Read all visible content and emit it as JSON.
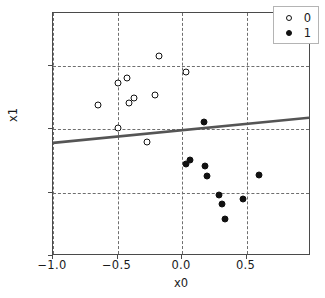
{
  "figure": {
    "background_color": "#ffffff",
    "axes_edge_color": "#4a4a4a",
    "grid_color": "#6e6e6e",
    "marker_color": "#111111",
    "line_color": "#555555"
  },
  "legend": {
    "position": "upper-right",
    "entries": [
      {
        "label": "0",
        "marker": "open-circle",
        "name": "legend-entry-class-0"
      },
      {
        "label": "1",
        "marker": "filled-circle",
        "name": "legend-entry-class-1"
      }
    ]
  },
  "chart_data": {
    "type": "scatter",
    "title": "",
    "xlabel": "x0",
    "ylabel": "x1",
    "xlim": [
      -1.0,
      1.0
    ],
    "ylim": [
      -1.0,
      0.92
    ],
    "grid": true,
    "grid_style": "dashed",
    "xticks": [
      -1.0,
      -0.5,
      0.0,
      0.5
    ],
    "xticklabels": [
      "−1.0",
      "−0.5",
      "0.0",
      "0.5"
    ],
    "yticks": [
      0.5,
      0.0,
      -0.5,
      -1.0
    ],
    "yticklabels": [
      "0.5",
      "0.0",
      "−0.5",
      "−1.0"
    ],
    "series": [
      {
        "name": "0",
        "marker": "open-circle",
        "points": [
          {
            "x": -0.65,
            "y": 0.19
          },
          {
            "x": -0.5,
            "y": 0.37
          },
          {
            "x": -0.5,
            "y": 0.01
          },
          {
            "x": -0.43,
            "y": 0.41
          },
          {
            "x": -0.41,
            "y": 0.21
          },
          {
            "x": -0.37,
            "y": 0.25
          },
          {
            "x": -0.27,
            "y": -0.1
          },
          {
            "x": -0.21,
            "y": 0.27
          },
          {
            "x": -0.18,
            "y": 0.58
          },
          {
            "x": 0.03,
            "y": 0.45
          }
        ]
      },
      {
        "name": "1",
        "marker": "filled-circle",
        "points": [
          {
            "x": 0.03,
            "y": -0.27
          },
          {
            "x": 0.06,
            "y": -0.24
          },
          {
            "x": 0.17,
            "y": 0.06
          },
          {
            "x": 0.18,
            "y": -0.29
          },
          {
            "x": 0.19,
            "y": -0.37
          },
          {
            "x": 0.29,
            "y": -0.52
          },
          {
            "x": 0.31,
            "y": -0.59
          },
          {
            "x": 0.33,
            "y": -0.71
          },
          {
            "x": 0.47,
            "y": -0.55
          },
          {
            "x": 0.6,
            "y": -0.36
          }
        ]
      }
    ],
    "annotations": [
      {
        "type": "decision-boundary-line",
        "name": "decision-boundary",
        "x_start": -1.0,
        "y_start": -0.115,
        "x_end": 1.0,
        "y_end": 0.085,
        "color": "#555555",
        "width": 2.6
      }
    ]
  }
}
